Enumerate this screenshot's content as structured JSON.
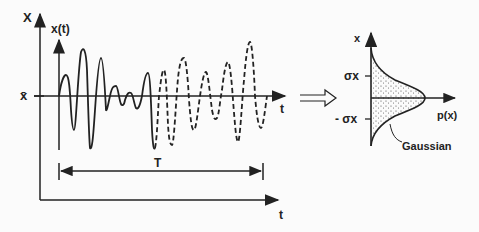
{
  "left_plot": {
    "outer_y_label": "X",
    "outer_x_label": "t",
    "signal_label": "x(t)",
    "signal_time_label": "t",
    "mean_label": "x̄",
    "period_label": "T"
  },
  "transform_arrow": "⇒",
  "right_plot": {
    "y_label": "x",
    "x_label": "p(x)",
    "sigma_pos_label": "σx",
    "sigma_neg_label": "- σx",
    "curve_label": "Gaussian"
  },
  "colors": {
    "ink": "#222222",
    "background": "#fbfbfb"
  }
}
